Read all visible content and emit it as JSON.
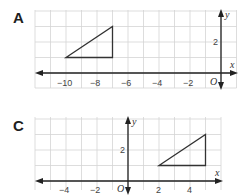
{
  "panels": [
    {
      "label": "A",
      "x_axis_label": "x",
      "y_axis_label": "y",
      "origin_label": "O",
      "x_ticks": [
        "−10",
        "−8",
        "−6",
        "−4",
        "−2"
      ],
      "y_ticks": [
        "2"
      ],
      "triangle": [
        [
          -10,
          1
        ],
        [
          -7,
          3
        ],
        [
          -7,
          1
        ]
      ]
    },
    {
      "label": "C",
      "x_axis_label": "x",
      "y_axis_label": "y",
      "origin_label": "O",
      "x_ticks": [
        "−4",
        "−2",
        "2",
        "4"
      ],
      "y_ticks": [
        "2"
      ],
      "triangle": [
        [
          2,
          1
        ],
        [
          5,
          3
        ],
        [
          5,
          1
        ]
      ]
    }
  ],
  "colors": {
    "grid": "#d4d4d4",
    "axis": "#222222",
    "shape": "#333333"
  }
}
